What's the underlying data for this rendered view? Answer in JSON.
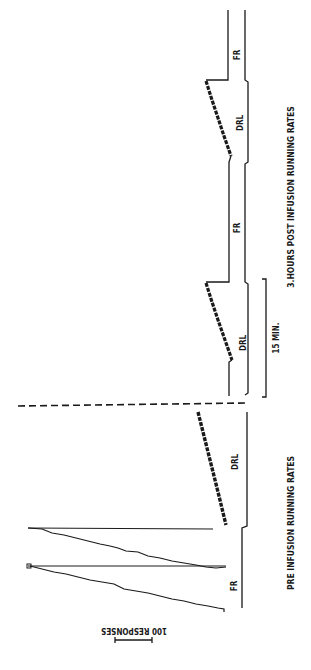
{
  "figure": {
    "orientation": "rotated 90 degrees clockwise",
    "panels": [
      {
        "label": "PRE INFUSION RUNNING RATES",
        "segments": [
          {
            "schedule": "FR",
            "label": "FR"
          },
          {
            "schedule": "DRL",
            "label": "DRL"
          }
        ]
      },
      {
        "label": "3 HOURS POST INFUSION RUNNING RATES",
        "segments": [
          {
            "schedule": "DRL",
            "label": "DRL"
          },
          {
            "schedule": "FR",
            "label": "FR"
          },
          {
            "schedule": "DRL",
            "label": "DRL"
          },
          {
            "schedule": "FR",
            "label": "FR"
          }
        ]
      }
    ],
    "labels": {
      "fr_bottom": "FR",
      "drl_bottom": "DRL",
      "drl_mid": "DRL",
      "fr_mid": "FR",
      "drl_top": "DRL",
      "fr_top": "FR",
      "pre_caption": "PRE INFUSION RUNNING RATES",
      "post_caption": "3.HOURS POST INFUSION RUNNING RATES",
      "time_scale": "15 MIN.",
      "response_scale": "100 RESPONSES"
    }
  }
}
